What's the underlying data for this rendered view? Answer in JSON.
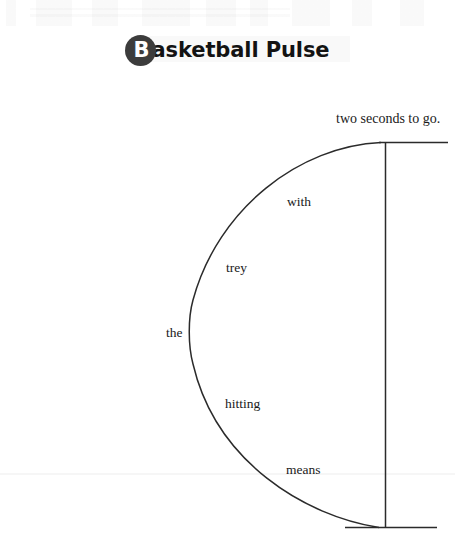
{
  "page": {
    "background_color": "#ffffff",
    "width": 455,
    "height": 543
  },
  "title": {
    "badge_letter": "B",
    "rest": "asketball Pulse",
    "full_text": "Basketball Pulse",
    "badge_fill": "#3c3c3c",
    "badge_text_color": "#ffffff",
    "text_color": "#131313"
  },
  "diagram": {
    "name": "basketball-pulse-arc-diagram",
    "stroke_color": "#2b2b2b",
    "faint_rule_color": "#f2f2f2",
    "caption": {
      "text": "two seconds to go.",
      "x": 336,
      "y": 117
    },
    "arc_words": [
      {
        "text": "with",
        "x": 287,
        "y": 195
      },
      {
        "text": "trey",
        "x": 226,
        "y": 261
      },
      {
        "text": "the",
        "x": 166,
        "y": 326
      },
      {
        "text": "hitting",
        "x": 225,
        "y": 397
      },
      {
        "text": "means",
        "x": 286,
        "y": 463
      }
    ],
    "sentence": "the hitting trey with means two seconds to go.",
    "geometry": {
      "top_horizontal": {
        "x1": 380,
        "y1": 142,
        "x2": 448,
        "y2": 142
      },
      "bottom_horizontal": {
        "x1": 345,
        "y1": 528,
        "x2": 437,
        "y2": 528
      },
      "vertical_line": {
        "x": 385,
        "y1": 142,
        "y2": 528
      },
      "arc_start": {
        "x": 381,
        "y": 142
      },
      "arc_leftmost": {
        "x": 190,
        "y": 331
      },
      "arc_end": {
        "x": 379,
        "y": 527
      },
      "faint_rule_y": 474
    }
  }
}
